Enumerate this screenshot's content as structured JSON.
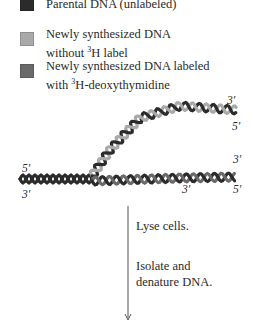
{
  "legend": [
    {
      "label": "Parental DNA (unlabeled)",
      "color": "#2b2b2b"
    },
    {
      "label_lines": [
        "Newly synthesized DNA",
        "without ",
        "H label"
      ],
      "sup": "3",
      "color": "#a9a9a9"
    },
    {
      "label_lines": [
        "Newly synthesized DNA labeled",
        "with ",
        "H-deoxythymidine"
      ],
      "sup": "3",
      "color": "#6a6a6a"
    }
  ],
  "strand_ends": {
    "upper_branch": {
      "top": "3′",
      "bottom": "5′"
    },
    "parental_left": {
      "top": "5′",
      "bottom": "3′"
    },
    "lower_branch_right": {
      "top": "3′",
      "bottom": "5′"
    },
    "lower_branch_gap": "3′"
  },
  "steps": [
    {
      "lines": [
        "Lyse cells."
      ]
    },
    {
      "lines": [
        "Isolate and",
        "denature DNA."
      ]
    }
  ],
  "colors": {
    "parental": "#2b2b2b",
    "unlabeled_new": "#a9a9a9",
    "labeled_new": "#6a6a6a",
    "arrow": "#555555"
  }
}
